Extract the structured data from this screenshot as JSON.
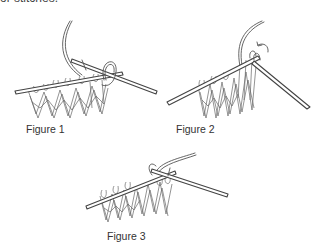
{
  "page": {
    "top_text": "or stitches."
  },
  "figures": [
    {
      "label": "Figure 1",
      "illustration": "knitting-needles-yarn-over-stitch-1"
    },
    {
      "label": "Figure 2",
      "illustration": "knitting-needles-stitch-slip-arrow"
    },
    {
      "label": "Figure 3",
      "illustration": "knitting-needles-stitch-complete"
    }
  ],
  "colors": {
    "line": "#555555",
    "text": "#333333",
    "background": "#ffffff"
  }
}
